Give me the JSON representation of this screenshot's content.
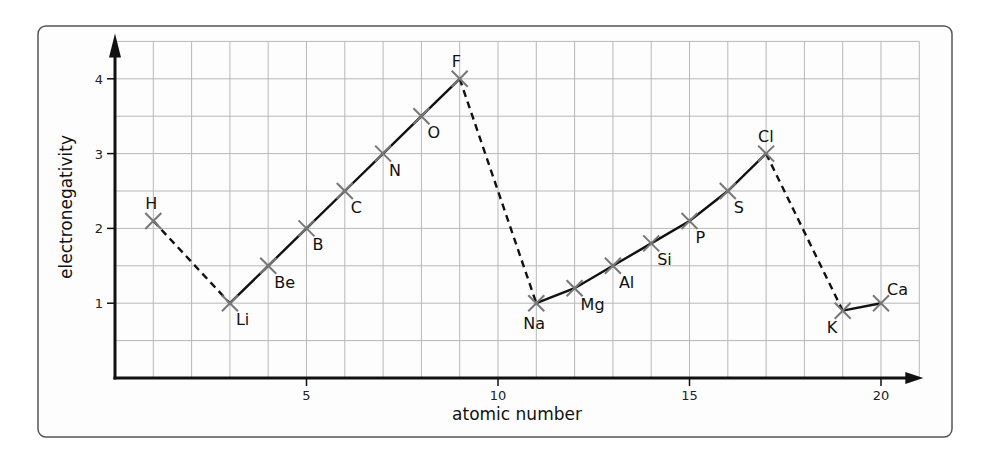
{
  "chart_data": {
    "type": "line",
    "title": "",
    "xlabel": "atomic number",
    "ylabel": "electronegativity",
    "xlim": [
      0,
      21
    ],
    "ylim": [
      0,
      4.5
    ],
    "grid": true,
    "x_ticks": [
      5,
      10,
      15,
      20
    ],
    "y_ticks": [
      1,
      2,
      3,
      4
    ],
    "legend": null,
    "points": [
      {
        "element": "H",
        "x": 1,
        "y": 2.1,
        "label_pos": "above"
      },
      {
        "element": "Li",
        "x": 3,
        "y": 1.0,
        "label_pos": "below-right"
      },
      {
        "element": "Be",
        "x": 4,
        "y": 1.5,
        "label_pos": "below-right"
      },
      {
        "element": "B",
        "x": 5,
        "y": 2.0,
        "label_pos": "below-right"
      },
      {
        "element": "C",
        "x": 6,
        "y": 2.5,
        "label_pos": "below-right"
      },
      {
        "element": "N",
        "x": 7,
        "y": 3.0,
        "label_pos": "below-right"
      },
      {
        "element": "O",
        "x": 8,
        "y": 3.5,
        "label_pos": "below-right"
      },
      {
        "element": "F",
        "x": 9,
        "y": 4.0,
        "label_pos": "above"
      },
      {
        "element": "Na",
        "x": 11,
        "y": 1.0,
        "label_pos": "below"
      },
      {
        "element": "Mg",
        "x": 12,
        "y": 1.2,
        "label_pos": "below-right"
      },
      {
        "element": "Al",
        "x": 13,
        "y": 1.5,
        "label_pos": "below-right"
      },
      {
        "element": "Si",
        "x": 14,
        "y": 1.8,
        "label_pos": "below-right"
      },
      {
        "element": "P",
        "x": 15,
        "y": 2.1,
        "label_pos": "below-right"
      },
      {
        "element": "S",
        "x": 16,
        "y": 2.5,
        "label_pos": "below-right"
      },
      {
        "element": "Cl",
        "x": 17,
        "y": 3.0,
        "label_pos": "above"
      },
      {
        "element": "K",
        "x": 19,
        "y": 0.9,
        "label_pos": "below-left"
      },
      {
        "element": "Ca",
        "x": 20,
        "y": 1.0,
        "label_pos": "above-right"
      }
    ],
    "segments": [
      {
        "from": "H",
        "to": "Li",
        "style": "dashed"
      },
      {
        "from": "Li",
        "to": "F",
        "style": "solid"
      },
      {
        "from": "F",
        "to": "Na",
        "style": "dashed"
      },
      {
        "from": "Na",
        "to": "Cl",
        "style": "solid"
      },
      {
        "from": "Cl",
        "to": "K",
        "style": "dashed"
      },
      {
        "from": "K",
        "to": "Ca",
        "style": "solid"
      }
    ],
    "series": [
      {
        "name": "Period 2 (Li–F)",
        "x": [
          3,
          4,
          5,
          6,
          7,
          8,
          9
        ],
        "values": [
          1.0,
          1.5,
          2.0,
          2.5,
          3.0,
          3.5,
          4.0
        ]
      },
      {
        "name": "Period 3 (Na–Cl)",
        "x": [
          11,
          12,
          13,
          14,
          15,
          16,
          17
        ],
        "values": [
          1.0,
          1.2,
          1.5,
          1.8,
          2.1,
          2.5,
          3.0
        ]
      },
      {
        "name": "Period 4 (K–Ca)",
        "x": [
          19,
          20
        ],
        "values": [
          0.9,
          1.0
        ]
      },
      {
        "name": "H",
        "x": [
          1
        ],
        "values": [
          2.1
        ]
      }
    ]
  },
  "colors": {
    "line": "#111111",
    "marker": "#777777",
    "grid": "#b8b8b8",
    "frame": "#555555",
    "background": "#fdfdfd"
  }
}
